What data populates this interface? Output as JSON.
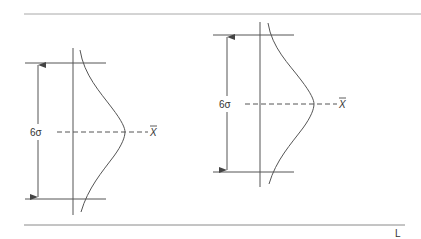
{
  "diagram": {
    "colors": {
      "line": "#555555",
      "rule": "#9a9a9a",
      "text": "#333333"
    },
    "axis_label": "L",
    "figures": [
      {
        "id": "left",
        "spread_label": "6σ",
        "mean_label": "X",
        "mean_bar": "‾"
      },
      {
        "id": "right",
        "spread_label": "6σ",
        "mean_label": "X",
        "mean_bar": "‾"
      }
    ]
  }
}
